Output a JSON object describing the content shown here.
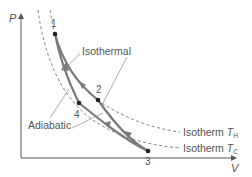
{
  "diagram": {
    "axes": {
      "y_label": "P",
      "x_label": "V"
    },
    "points": [
      {
        "id": "1",
        "label": "1",
        "x": 55,
        "y": 34
      },
      {
        "id": "2",
        "label": "2",
        "x": 98,
        "y": 100
      },
      {
        "id": "3",
        "label": "3",
        "x": 148,
        "y": 151
      },
      {
        "id": "4",
        "label": "4",
        "x": 79,
        "y": 103
      }
    ],
    "labels": {
      "isothermal": "Isothermal",
      "adiabatic": "Adiabatic",
      "isotherm_hot_prefix": "Isotherm ",
      "isotherm_hot_T": "T",
      "isotherm_hot_sub": "H",
      "isotherm_cold_prefix": "Isotherm ",
      "isotherm_cold_T": "T",
      "isotherm_cold_sub": "C"
    },
    "colors": {
      "curve": "#7a7a7a",
      "axis": "#555555",
      "dashed": "#777777",
      "point": "#222222",
      "text": "#555555"
    }
  }
}
